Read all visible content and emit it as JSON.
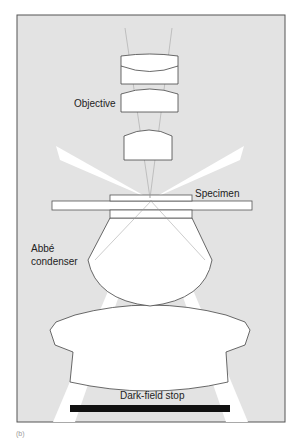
{
  "diagram": {
    "labels": {
      "objective": "Objective",
      "specimen": "Specimen",
      "condenser_line1": "Abbé",
      "condenser_line2": "condenser",
      "stop": "Dark-field stop"
    },
    "caption": "(b)",
    "colors": {
      "background": "#e3e3e3",
      "frame": "#555555",
      "lens_fill": "#ffffff",
      "stop_fill": "#111111"
    }
  }
}
